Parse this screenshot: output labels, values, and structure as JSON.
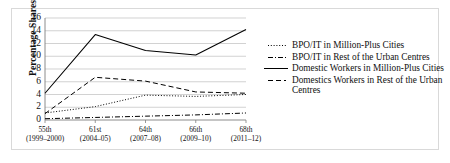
{
  "chart_data": {
    "type": "line",
    "title": "",
    "xlabel": "",
    "ylabel": "Percentage Shares",
    "ylim": [
      0,
      16
    ],
    "ytick_step": 2,
    "yticks": [
      "16",
      "14",
      "12",
      "10",
      "8",
      "6",
      "4",
      "2",
      "0"
    ],
    "grid": true,
    "grid_axis": "y",
    "legend_position": "right",
    "categories": [
      "55th\n(1999–2000)",
      "61st\n(2004–05)",
      "64th\n(2007–08)",
      "66th\n(2009–10)",
      "68th\n(2011–12)"
    ],
    "x_tick_labels": [
      {
        "round": "55th",
        "years": "(1999–2000)"
      },
      {
        "round": "61st",
        "years": "(2004–05)"
      },
      {
        "round": "64th",
        "years": "(2007–08)"
      },
      {
        "round": "66th",
        "years": "(2009–10)"
      },
      {
        "round": "68th",
        "years": "(2011–12)"
      }
    ],
    "series": [
      {
        "name": "BPO/IT in Million-Plus Cities",
        "style": "dotted",
        "color": "#000000",
        "values": [
          1.1,
          2.1,
          3.9,
          3.7,
          4.0
        ]
      },
      {
        "name": "BPO/IT in Rest of the Urban Centres",
        "style": "dashdot",
        "color": "#000000",
        "values": [
          0.2,
          0.4,
          0.6,
          0.8,
          1.1
        ]
      },
      {
        "name": "Domestic Workers in Million-Plus Cities",
        "style": "solid",
        "color": "#000000",
        "values": [
          4.2,
          13.4,
          10.9,
          10.2,
          14.2
        ]
      },
      {
        "name": "Domestics Workers in Rest of the Urban Centres",
        "style": "dashed",
        "color": "#000000",
        "values": [
          1.0,
          6.7,
          6.1,
          4.4,
          4.2
        ]
      }
    ]
  },
  "legend": {
    "items": [
      {
        "label": "BPO/IT in Million-Plus Cities",
        "style": "dotted"
      },
      {
        "label": "BPO/IT in Rest of the Urban Centres",
        "style": "dashdot"
      },
      {
        "label": "Domestic Workers in Million-Plus Cities",
        "style": "solid"
      },
      {
        "label": "Domestics Workers in Rest of the Urban Centres",
        "style": "dashed"
      }
    ]
  },
  "colors": {
    "line": "#000000",
    "grid": "#bfbfbf",
    "axis": "#808080",
    "frame": "#d9d9d9",
    "text": "#111111",
    "background": "#ffffff"
  }
}
